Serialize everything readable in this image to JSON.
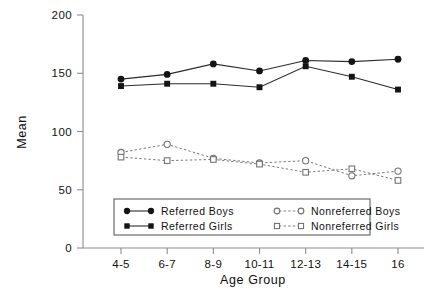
{
  "chart_data": {
    "type": "line",
    "title": "",
    "xlabel": "Age Group",
    "ylabel": "Mean",
    "categories": [
      "4-5",
      "6-7",
      "8-9",
      "10-11",
      "12-13",
      "14-15",
      "16"
    ],
    "ylim": [
      0,
      200
    ],
    "yticks": [
      0,
      50,
      100,
      150,
      200
    ],
    "ytick_labels": [
      "0",
      "50",
      "100",
      "150",
      "200"
    ],
    "grid": false,
    "legend_position": "lower-center-inside",
    "series": [
      {
        "name": "Referred Boys",
        "marker": "filled-circle",
        "linestyle": "solid",
        "color": "#141414",
        "values": [
          145,
          149,
          158,
          152,
          161,
          160,
          162
        ]
      },
      {
        "name": "Referred Girls",
        "marker": "filled-square",
        "linestyle": "solid",
        "color": "#141414",
        "values": [
          139,
          141,
          141,
          138,
          156,
          147,
          136
        ]
      },
      {
        "name": "Nonreferred Boys",
        "marker": "open-circle",
        "linestyle": "dashed",
        "color": "#6f6f6f",
        "values": [
          82,
          89,
          77,
          73,
          75,
          62,
          66
        ]
      },
      {
        "name": "Nonreferred Girls",
        "marker": "open-square",
        "linestyle": "dashed",
        "color": "#6f6f6f",
        "values": [
          78,
          75,
          76,
          72,
          65,
          68,
          58
        ]
      }
    ]
  },
  "legend": {
    "entries": [
      {
        "label": "Referred Boys",
        "marker": "filled-circle",
        "linestyle": "solid"
      },
      {
        "label": "Nonreferred Boys",
        "marker": "open-circle",
        "linestyle": "dashed"
      },
      {
        "label": "Referred Girls",
        "marker": "filled-square",
        "linestyle": "solid"
      },
      {
        "label": "Nonreferred Girls",
        "marker": "open-square",
        "linestyle": "dashed"
      }
    ]
  },
  "caption": {
    "text": ""
  }
}
